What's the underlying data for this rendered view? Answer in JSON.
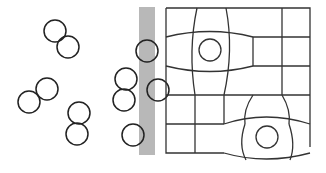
{
  "diagram": {
    "title": "",
    "colors": {
      "background": "#ffffff",
      "stroke": "#222222",
      "membrane": "#b8b8b8",
      "grid": "#333333"
    },
    "free_cells": [
      {
        "id": "pair-1a"
      },
      {
        "id": "pair-1b"
      },
      {
        "id": "pair-2a"
      },
      {
        "id": "pair-2b"
      },
      {
        "id": "pair-3a"
      },
      {
        "id": "pair-3b"
      },
      {
        "id": "pair-4a"
      },
      {
        "id": "pair-4b"
      },
      {
        "id": "single-1"
      },
      {
        "id": "membrane-cell-1"
      },
      {
        "id": "membrane-cell-2"
      }
    ],
    "grid": {
      "rows": 5,
      "cols": 5,
      "embedded_cells": 2
    }
  }
}
